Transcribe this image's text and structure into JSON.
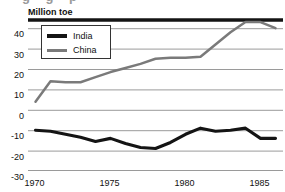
{
  "figure": {
    "clipped_headline_fragment": "g        g   p",
    "axis_title": "Million toe"
  },
  "legend": {
    "items": [
      {
        "label": "India",
        "color": "#141414"
      },
      {
        "label": "China",
        "color": "#7a7a7a"
      }
    ]
  },
  "axes": {
    "y_ticks": [
      "40",
      "30",
      "20",
      "10",
      "0",
      "-10",
      "-20",
      "-30"
    ],
    "x_ticks": [
      "1970",
      "1975",
      "1980",
      "1985"
    ]
  },
  "chart_data": {
    "type": "line",
    "title": "",
    "subtitle": "",
    "xlabel": "",
    "ylabel": "Million toe",
    "xlim": [
      1969.5,
      1986.5
    ],
    "ylim": [
      -30,
      45
    ],
    "yticks": [
      40,
      30,
      20,
      10,
      0,
      -10,
      -20,
      -30
    ],
    "xticks": [
      1970,
      1975,
      1980,
      1985
    ],
    "xtick_labels": [
      "1970",
      "1975",
      "1980",
      "1985"
    ],
    "minor_xticks": [
      1971,
      1972,
      1973,
      1974,
      1976,
      1977,
      1978,
      1979,
      1981,
      1982,
      1983,
      1984,
      1986
    ],
    "grid": "horizontal",
    "legend_position": "upper-left-inside",
    "x": [
      1970,
      1971,
      1972,
      1973,
      1974,
      1975,
      1976,
      1977,
      1978,
      1979,
      1980,
      1981,
      1982,
      1983,
      1984,
      1985,
      1986
    ],
    "series": [
      {
        "name": "China",
        "color": "#7a7a7a",
        "values": [
          4,
          14,
          13.5,
          13.5,
          16,
          18.5,
          20.5,
          22.5,
          25,
          25.5,
          25.5,
          26,
          32,
          38,
          43,
          43,
          40
        ]
      },
      {
        "name": "India",
        "color": "#141414",
        "values": [
          -10,
          -10.5,
          -12,
          -13.5,
          -15.5,
          -14,
          -16.5,
          -18.5,
          -19,
          -16,
          -12,
          -9,
          -10.5,
          -10,
          -9,
          -14,
          -14
        ]
      }
    ]
  }
}
